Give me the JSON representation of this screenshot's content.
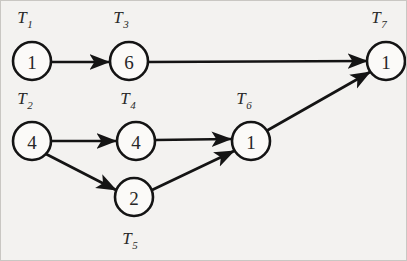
{
  "figure": {
    "kind": "task-precedence-graph",
    "background_color": "#f3f2f0",
    "ink_color": "#141414",
    "border_color": "#c9c7c3"
  },
  "nodes": [
    {
      "id": "T1",
      "label": "T",
      "subscript": "1",
      "value": "1",
      "cx": 31,
      "cy": 60,
      "r": 19,
      "label_x": 24,
      "label_y": 22
    },
    {
      "id": "T2",
      "label": "T",
      "subscript": "2",
      "value": "4",
      "cx": 31,
      "cy": 140,
      "r": 19,
      "label_x": 24,
      "label_y": 103
    },
    {
      "id": "T3",
      "label": "T",
      "subscript": "3",
      "value": "6",
      "cx": 128,
      "cy": 60,
      "r": 19,
      "label_x": 120,
      "label_y": 22
    },
    {
      "id": "T4",
      "label": "T",
      "subscript": "4",
      "value": "4",
      "cx": 135,
      "cy": 140,
      "r": 19,
      "label_x": 127,
      "label_y": 103
    },
    {
      "id": "T5",
      "label": "T",
      "subscript": "5",
      "value": "2",
      "cx": 133,
      "cy": 196,
      "r": 19,
      "label_x": 129,
      "label_y": 243
    },
    {
      "id": "T6",
      "label": "T",
      "subscript": "6",
      "value": "1",
      "cx": 250,
      "cy": 140,
      "r": 19,
      "label_x": 243,
      "label_y": 103
    },
    {
      "id": "T7",
      "label": "T",
      "subscript": "7",
      "value": "1",
      "cx": 385,
      "cy": 60,
      "r": 19,
      "label_x": 378,
      "label_y": 22
    }
  ],
  "edges": [
    {
      "id": "e1",
      "from": "T1",
      "to": "T3",
      "x1": 50,
      "y1": 61,
      "x2": 108,
      "y2": 61
    },
    {
      "id": "e2",
      "from": "T3",
      "to": "T7",
      "x1": 147,
      "y1": 61,
      "x2": 366,
      "y2": 60
    },
    {
      "id": "e3",
      "from": "T2",
      "to": "T4",
      "x1": 50,
      "y1": 140,
      "x2": 115,
      "y2": 140
    },
    {
      "id": "e4",
      "from": "T2",
      "to": "T5",
      "x1": 45,
      "y1": 153,
      "x2": 115,
      "y2": 189
    },
    {
      "id": "e5",
      "from": "T4",
      "to": "T6",
      "x1": 154,
      "y1": 139,
      "x2": 230,
      "y2": 138
    },
    {
      "id": "e6",
      "from": "T5",
      "to": "T6",
      "x1": 151,
      "y1": 189,
      "x2": 233,
      "y2": 150
    },
    {
      "id": "e7",
      "from": "T6",
      "to": "T7",
      "x1": 267,
      "y1": 129,
      "x2": 369,
      "y2": 71
    }
  ],
  "chart_data": {
    "type": "diagram",
    "title": "",
    "nodes": [
      {
        "name": "T1",
        "value": 1
      },
      {
        "name": "T2",
        "value": 4
      },
      {
        "name": "T3",
        "value": 6
      },
      {
        "name": "T4",
        "value": 4
      },
      {
        "name": "T5",
        "value": 2
      },
      {
        "name": "T6",
        "value": 1
      },
      {
        "name": "T7",
        "value": 1
      }
    ],
    "edges": [
      [
        "T1",
        "T3"
      ],
      [
        "T3",
        "T7"
      ],
      [
        "T2",
        "T4"
      ],
      [
        "T2",
        "T5"
      ],
      [
        "T4",
        "T6"
      ],
      [
        "T5",
        "T6"
      ],
      [
        "T6",
        "T7"
      ]
    ]
  }
}
